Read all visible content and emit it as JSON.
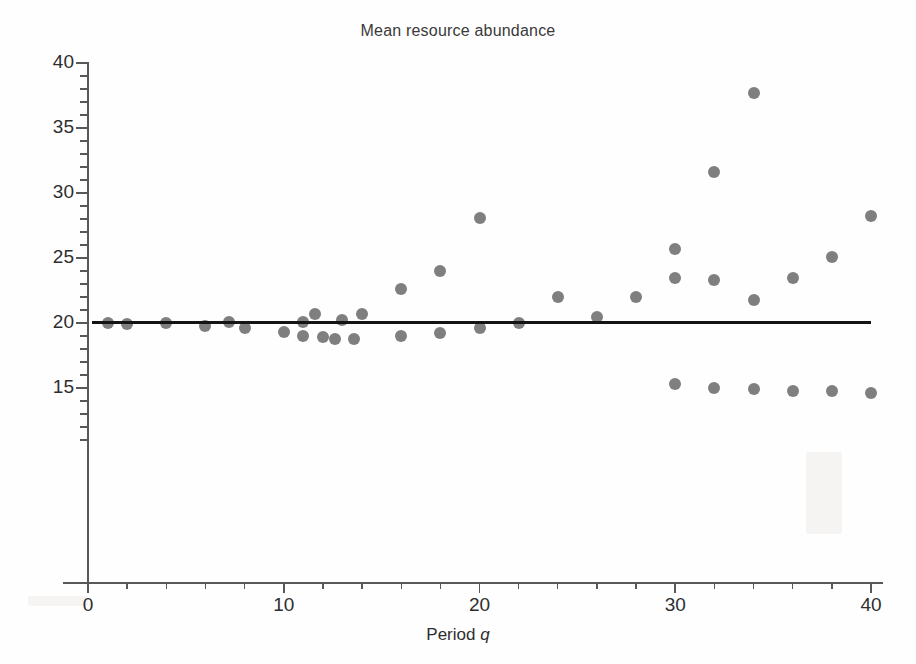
{
  "chart_data": {
    "type": "scatter",
    "title": "Mean resource abundance",
    "xlabel": "Period q",
    "ylabel": "",
    "xlim": [
      0,
      41
    ],
    "ylim": [
      0,
      40
    ],
    "grid": false,
    "legend": "none",
    "marker_color": "#7f7f7f",
    "trend_color": "#141414",
    "x_ticks_major": [
      0,
      10,
      20,
      30,
      40
    ],
    "x_ticks_minor": [
      2,
      4,
      6,
      8,
      12,
      14,
      16,
      18,
      22,
      24,
      26,
      28,
      32,
      34,
      36,
      38
    ],
    "y_ticks_major": [
      15,
      20,
      25,
      30,
      35,
      40
    ],
    "y_ticks_minor": [
      11,
      12,
      13,
      14,
      16,
      17,
      18,
      19,
      21,
      22,
      23,
      24,
      26,
      27,
      28,
      29,
      31,
      32,
      33,
      34,
      36,
      37,
      38,
      39
    ],
    "x_tick_labels": [
      "0",
      "10",
      "20",
      "30",
      "40"
    ],
    "y_tick_labels": [
      "15",
      "20",
      "25",
      "30",
      "35",
      "40"
    ],
    "points": [
      {
        "x": 1.0,
        "y": 20.0
      },
      {
        "x": 2.0,
        "y": 19.9
      },
      {
        "x": 4.0,
        "y": 20.0
      },
      {
        "x": 6.0,
        "y": 19.8
      },
      {
        "x": 7.2,
        "y": 20.1
      },
      {
        "x": 8.0,
        "y": 19.6
      },
      {
        "x": 10.0,
        "y": 19.3
      },
      {
        "x": 11.0,
        "y": 20.1
      },
      {
        "x": 11.0,
        "y": 19.0
      },
      {
        "x": 11.6,
        "y": 20.7
      },
      {
        "x": 12.0,
        "y": 18.9
      },
      {
        "x": 12.6,
        "y": 18.8
      },
      {
        "x": 13.0,
        "y": 20.2
      },
      {
        "x": 13.6,
        "y": 18.8
      },
      {
        "x": 14.0,
        "y": 20.7
      },
      {
        "x": 16.0,
        "y": 22.6
      },
      {
        "x": 16.0,
        "y": 19.0
      },
      {
        "x": 18.0,
        "y": 24.0
      },
      {
        "x": 18.0,
        "y": 19.2
      },
      {
        "x": 20.0,
        "y": 28.1
      },
      {
        "x": 20.0,
        "y": 19.6
      },
      {
        "x": 22.0,
        "y": 20.0
      },
      {
        "x": 24.0,
        "y": 22.0
      },
      {
        "x": 26.0,
        "y": 20.5
      },
      {
        "x": 28.0,
        "y": 22.0
      },
      {
        "x": 30.0,
        "y": 25.7
      },
      {
        "x": 30.0,
        "y": 23.5
      },
      {
        "x": 30.0,
        "y": 15.3
      },
      {
        "x": 32.0,
        "y": 31.6
      },
      {
        "x": 32.0,
        "y": 23.3
      },
      {
        "x": 32.0,
        "y": 15.0
      },
      {
        "x": 34.0,
        "y": 37.7
      },
      {
        "x": 34.0,
        "y": 21.8
      },
      {
        "x": 34.0,
        "y": 14.9
      },
      {
        "x": 36.0,
        "y": 23.5
      },
      {
        "x": 36.0,
        "y": 14.8
      },
      {
        "x": 38.0,
        "y": 25.1
      },
      {
        "x": 38.0,
        "y": 14.8
      },
      {
        "x": 40.0,
        "y": 28.2
      },
      {
        "x": 40.0,
        "y": 14.6
      }
    ],
    "trend": {
      "label": "fitted mean line",
      "x_start": 0.2,
      "x_end": 40.0,
      "y_start": 20.05,
      "y_end": 20.0
    }
  }
}
